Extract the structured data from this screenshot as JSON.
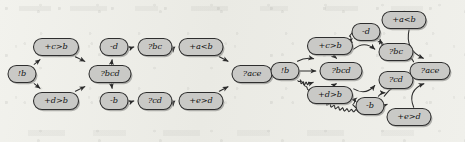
{
  "figure": {
    "kind": "two-panel-directed-graph",
    "background_color": "#eeeee9",
    "node_fill": "#c9c9c6",
    "node_stroke": "#2e2e2e",
    "edge_stroke": "#2b2b2b",
    "text_color": "#111111"
  },
  "panels": [
    {
      "id": "left",
      "name": "sparse-dependency-graph",
      "nodes": [
        {
          "id": "L-start",
          "label": "!b",
          "x": 22,
          "y": 74,
          "w": 28,
          "h": 17
        },
        {
          "id": "L-cgtb",
          "label": "+c>b",
          "x": 56,
          "y": 47,
          "w": 45,
          "h": 17
        },
        {
          "id": "L-dgtb",
          "label": "+d>b",
          "x": 56,
          "y": 101,
          "w": 45,
          "h": 17
        },
        {
          "id": "L-bcd",
          "label": "?bcd",
          "x": 110,
          "y": 74,
          "w": 42,
          "h": 17
        },
        {
          "id": "L-md",
          "label": "-d",
          "x": 114,
          "y": 47,
          "w": 28,
          "h": 17
        },
        {
          "id": "L-mb",
          "label": "-b",
          "x": 114,
          "y": 101,
          "w": 28,
          "h": 17
        },
        {
          "id": "L-bc",
          "label": "?bc",
          "x": 155,
          "y": 47,
          "w": 34,
          "h": 17
        },
        {
          "id": "L-cd",
          "label": "?cd",
          "x": 155,
          "y": 101,
          "w": 34,
          "h": 17
        },
        {
          "id": "L-altb",
          "label": "+a<b",
          "x": 201,
          "y": 47,
          "w": 44,
          "h": 17
        },
        {
          "id": "L-egtd",
          "label": "+e>d",
          "x": 201,
          "y": 101,
          "w": 44,
          "h": 17
        },
        {
          "id": "L-ace",
          "label": "?ace",
          "x": 252,
          "y": 74,
          "w": 40,
          "h": 17
        }
      ],
      "edges": [
        {
          "from": "L-start",
          "to": "L-cgtb",
          "style": "solid"
        },
        {
          "from": "L-start",
          "to": "L-dgtb",
          "style": "solid"
        },
        {
          "from": "L-cgtb",
          "to": "L-bcd",
          "style": "solid"
        },
        {
          "from": "L-dgtb",
          "to": "L-bcd",
          "style": "solid"
        },
        {
          "from": "L-bcd",
          "to": "L-md",
          "style": "solid"
        },
        {
          "from": "L-bcd",
          "to": "L-mb",
          "style": "solid"
        },
        {
          "from": "L-md",
          "to": "L-bc",
          "style": "solid"
        },
        {
          "from": "L-bc",
          "to": "L-altb",
          "style": "solid"
        },
        {
          "from": "L-altb",
          "to": "L-ace",
          "style": "solid"
        },
        {
          "from": "L-mb",
          "to": "L-cd",
          "style": "solid"
        },
        {
          "from": "L-cd",
          "to": "L-egtd",
          "style": "solid"
        },
        {
          "from": "L-egtd",
          "to": "L-ace",
          "style": "solid"
        }
      ]
    },
    {
      "id": "right",
      "name": "dense-transitive-graph",
      "nodes": [
        {
          "id": "R-start",
          "label": "!b",
          "x": 285,
          "y": 71,
          "w": 28,
          "h": 17
        },
        {
          "id": "R-cgtb",
          "label": "+c>b",
          "x": 330,
          "y": 46,
          "w": 45,
          "h": 17
        },
        {
          "id": "R-dgtb",
          "label": "+d>b",
          "x": 330,
          "y": 95,
          "w": 45,
          "h": 17
        },
        {
          "id": "R-bcd",
          "label": "?bcd",
          "x": 341,
          "y": 71,
          "w": 42,
          "h": 17
        },
        {
          "id": "R-md",
          "label": "-d",
          "x": 366,
          "y": 32,
          "w": 28,
          "h": 17
        },
        {
          "id": "R-mb",
          "label": "-b",
          "x": 370,
          "y": 106,
          "w": 28,
          "h": 17
        },
        {
          "id": "R-altb",
          "label": "+a<b",
          "x": 404,
          "y": 20,
          "w": 44,
          "h": 17
        },
        {
          "id": "R-bc",
          "label": "?bc",
          "x": 396,
          "y": 52,
          "w": 34,
          "h": 17
        },
        {
          "id": "R-cd",
          "label": "?cd",
          "x": 396,
          "y": 80,
          "w": 34,
          "h": 17
        },
        {
          "id": "R-egtd",
          "label": "+e>d",
          "x": 409,
          "y": 117,
          "w": 44,
          "h": 17
        },
        {
          "id": "R-ace",
          "label": "?ace",
          "x": 430,
          "y": 71,
          "w": 40,
          "h": 17
        }
      ],
      "edges": [
        {
          "from": "R-start",
          "to": "R-cgtb",
          "style": "solid"
        },
        {
          "from": "R-start",
          "to": "R-bcd",
          "style": "solid"
        },
        {
          "from": "R-start",
          "to": "R-dgtb",
          "style": "squiggly"
        },
        {
          "from": "R-start",
          "to": "R-egtd",
          "style": "squiggly"
        },
        {
          "from": "R-cgtb",
          "to": "R-bcd",
          "style": "solid"
        },
        {
          "from": "R-cgtb",
          "to": "R-md",
          "style": "solid"
        },
        {
          "from": "R-cgtb",
          "to": "R-bc",
          "style": "solid"
        },
        {
          "from": "R-cgtb",
          "to": "R-altb",
          "style": "solid"
        },
        {
          "from": "R-dgtb",
          "to": "R-bcd",
          "style": "solid"
        },
        {
          "from": "R-dgtb",
          "to": "R-mb",
          "style": "solid"
        },
        {
          "from": "R-dgtb",
          "to": "R-cd",
          "style": "solid"
        },
        {
          "from": "R-dgtb",
          "to": "R-egtd",
          "style": "solid"
        },
        {
          "from": "R-md",
          "to": "R-bc",
          "style": "solid"
        },
        {
          "from": "R-md",
          "to": "R-ace",
          "style": "solid"
        },
        {
          "from": "R-mb",
          "to": "R-cd",
          "style": "solid"
        },
        {
          "from": "R-mb",
          "to": "R-ace",
          "style": "solid"
        },
        {
          "from": "R-altb",
          "to": "R-ace",
          "style": "solid"
        },
        {
          "from": "R-bc",
          "to": "R-ace",
          "style": "solid"
        },
        {
          "from": "R-cd",
          "to": "R-ace",
          "style": "solid"
        },
        {
          "from": "R-egtd",
          "to": "R-ace",
          "style": "solid"
        }
      ]
    }
  ]
}
